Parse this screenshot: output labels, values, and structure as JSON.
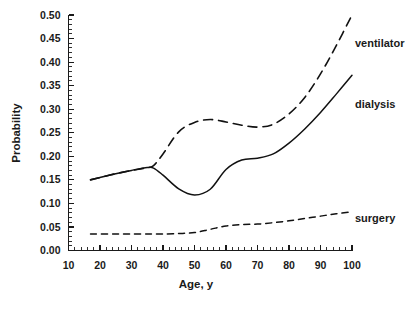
{
  "chart_data": {
    "type": "line",
    "title": "",
    "subtitle": "",
    "xlabel": "Age, y",
    "ylabel": "Probability",
    "xlim": [
      10,
      100
    ],
    "ylim": [
      0.0,
      0.5
    ],
    "grid": false,
    "legend_position": "right-inline-labels",
    "x_ticks": [
      10,
      20,
      30,
      40,
      50,
      60,
      70,
      80,
      90,
      100
    ],
    "x_tick_labels": [
      "10",
      "20",
      "30",
      "40",
      "50",
      "60",
      "70",
      "80",
      "90",
      "100"
    ],
    "x_minor_tick_step": 2,
    "y_ticks": [
      0.0,
      0.05,
      0.1,
      0.15,
      0.2,
      0.25,
      0.3,
      0.35,
      0.4,
      0.45,
      0.5
    ],
    "y_tick_labels": [
      "0.00",
      "0.05",
      "0.10",
      "0.15",
      "0.20",
      "0.25",
      "0.30",
      "0.35",
      "0.40",
      "0.45",
      "0.50"
    ],
    "y_minor_tick_step": 0.01,
    "x": [
      17,
      20,
      25,
      30,
      35,
      37,
      40,
      45,
      50,
      55,
      60,
      65,
      70,
      75,
      80,
      85,
      90,
      95,
      100
    ],
    "series": [
      {
        "name": "ventilator",
        "style": "long-dashed",
        "label": "ventilator",
        "values": [
          0.15,
          0.155,
          0.163,
          0.17,
          0.176,
          0.18,
          0.205,
          0.252,
          0.272,
          0.278,
          0.273,
          0.266,
          0.262,
          0.268,
          0.29,
          0.325,
          0.375,
          0.435,
          0.5
        ]
      },
      {
        "name": "dialysis",
        "style": "solid",
        "label": "dialysis",
        "values": [
          0.15,
          0.155,
          0.163,
          0.17,
          0.176,
          0.175,
          0.16,
          0.131,
          0.118,
          0.13,
          0.172,
          0.192,
          0.196,
          0.205,
          0.228,
          0.258,
          0.293,
          0.332,
          0.372
        ]
      },
      {
        "name": "surgery",
        "style": "short-dashed",
        "label": "surgery",
        "values": [
          0.035,
          0.035,
          0.035,
          0.035,
          0.035,
          0.035,
          0.035,
          0.036,
          0.038,
          0.045,
          0.052,
          0.055,
          0.056,
          0.059,
          0.063,
          0.068,
          0.073,
          0.078,
          0.082
        ]
      }
    ]
  },
  "labels": {
    "ventilator": "ventilator",
    "dialysis": "dialysis",
    "surgery": "surgery",
    "x_axis_title": "Age, y",
    "y_axis_title": "Probability"
  }
}
